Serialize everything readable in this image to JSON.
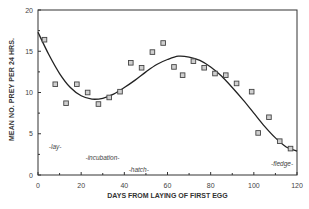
{
  "chart_data": {
    "type": "scatter",
    "title": "",
    "xlabel": "DAYS FROM LAYING OF FIRST EGG",
    "ylabel": "MEAN NO. PREY PER 24 HRS.",
    "xlim": [
      0,
      120
    ],
    "ylim": [
      0,
      20
    ],
    "xticks": [
      0,
      20,
      40,
      60,
      80,
      100,
      120
    ],
    "yticks": [
      0,
      5,
      10,
      15,
      20
    ],
    "grid": false,
    "legend": null,
    "series": [
      {
        "name": "observed",
        "marker": "square",
        "x": [
          3,
          8,
          13,
          18,
          23,
          28,
          33,
          38,
          43,
          48,
          53,
          58,
          63,
          67,
          72,
          77,
          82,
          87,
          92,
          99,
          102,
          107,
          112,
          117
        ],
        "y": [
          16.4,
          11.0,
          8.7,
          11.0,
          10.0,
          8.6,
          9.4,
          10.1,
          13.6,
          13.0,
          14.9,
          16.0,
          13.1,
          12.1,
          13.8,
          13.0,
          12.3,
          12.1,
          11.1,
          10.1,
          5.1,
          7.0,
          4.1,
          3.2
        ]
      },
      {
        "name": "fitted curve",
        "type": "line",
        "x": [
          0,
          5,
          10,
          15,
          20,
          25,
          30,
          35,
          40,
          45,
          50,
          55,
          60,
          65,
          70,
          75,
          80,
          85,
          90,
          95,
          100,
          105,
          110,
          115,
          120
        ],
        "y": [
          17.3,
          14.6,
          12.3,
          10.6,
          9.6,
          9.2,
          9.3,
          9.8,
          10.6,
          11.5,
          12.5,
          13.4,
          14.0,
          14.4,
          14.3,
          13.9,
          13.1,
          12.0,
          10.6,
          9.1,
          7.5,
          5.9,
          4.5,
          3.4,
          2.9
        ]
      }
    ],
    "annotations": [
      {
        "text": "-lay-",
        "x": 5,
        "y": 3.5
      },
      {
        "text": "-incubation-",
        "x": 22,
        "y": 2.1
      },
      {
        "text": "-hatch-",
        "x": 42,
        "y": 0.7
      },
      {
        "text": "-fledge-",
        "x": 108,
        "y": 1.4
      }
    ]
  }
}
